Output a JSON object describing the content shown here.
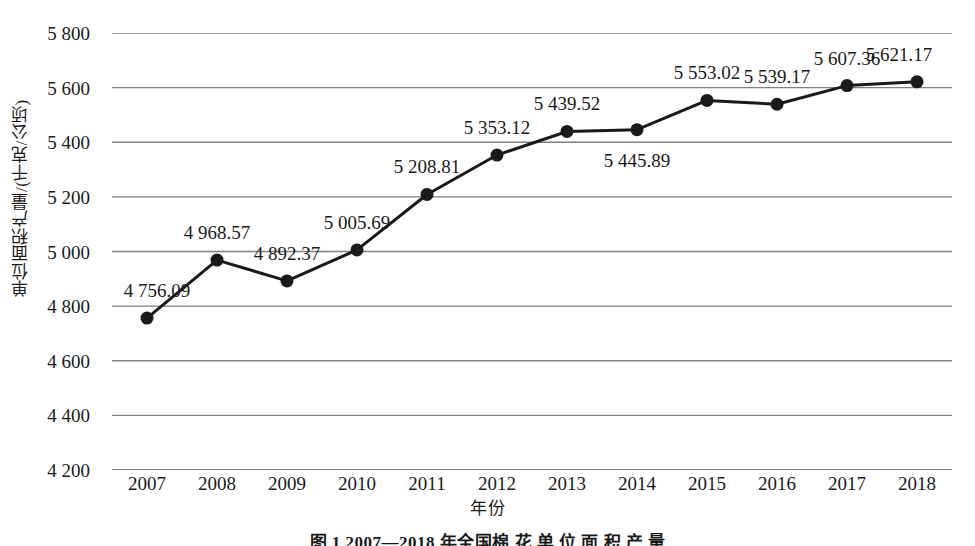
{
  "chart_data": {
    "type": "line",
    "title": "",
    "categories": [
      "2007",
      "2008",
      "2009",
      "2010",
      "2011",
      "2012",
      "2013",
      "2014",
      "2015",
      "2016",
      "2017",
      "2018"
    ],
    "values": [
      4756.09,
      4968.57,
      4892.37,
      5005.69,
      5208.81,
      5353.12,
      5439.52,
      5445.89,
      5553.02,
      5539.17,
      5607.36,
      5621.17
    ],
    "point_labels": [
      "4 756.09",
      "4 968.57",
      "4 892.37",
      "5 005.69",
      "5 208.81",
      "5 353.12",
      "5 439.52",
      "5 445.89",
      "5 553.02",
      "5 539.17",
      "5 607.36",
      "5 621.17"
    ],
    "label_positions": [
      "above",
      "above",
      "above",
      "above",
      "above",
      "above",
      "above",
      "below",
      "above",
      "above",
      "above",
      "above"
    ],
    "xlabel": "年份",
    "ylabel": "单位面积产量/(千克/公顷)",
    "ylim": [
      4200,
      5800
    ],
    "ytick_values": [
      4200,
      4400,
      4600,
      4800,
      5000,
      5200,
      5400,
      5600,
      5800
    ],
    "ytick_labels": [
      "4 200",
      "4 400",
      "4 600",
      "4 800",
      "5 000",
      "5 200",
      "5 400",
      "5 600",
      "5 800"
    ],
    "grid": "horizontal",
    "legend": "none",
    "series_color": "#1a1a1a",
    "grid_color": "#808080",
    "marker": "filled-circle"
  },
  "caption": {
    "text": "图 1  2007—2018 年全国棉 花 单 位 面 积 产 量"
  }
}
